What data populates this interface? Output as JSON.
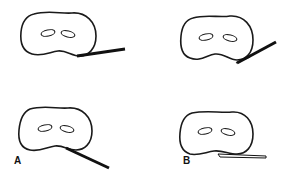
{
  "figure": {
    "panels": [
      {
        "id": "top-left",
        "description": "oval outline with two holes, instrument extending right nearly horizontal"
      },
      {
        "id": "top-right",
        "description": "oval outline with two holes, instrument angled up-right"
      },
      {
        "id": "bottom-left",
        "description": "oval outline with two holes, instrument angled down-right",
        "label": "A"
      },
      {
        "id": "bottom-right",
        "description": "oval outline with two holes, instrument flat under lower edge",
        "label": "B"
      }
    ],
    "labels": {
      "a": "A",
      "b": "B"
    },
    "colors": {
      "stroke": "#1a1a1a",
      "background": "#ffffff"
    }
  }
}
